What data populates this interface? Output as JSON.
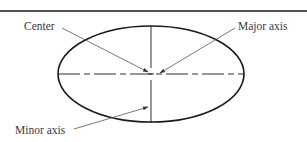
{
  "diagram": {
    "type": "ellipse-anatomy",
    "labels": {
      "center": "Center",
      "major_axis": "Major axis",
      "minor_axis": "Minor axis"
    },
    "colors": {
      "stroke": "#1a1a1a",
      "leader": "#555555",
      "text": "#3a3a3a",
      "background": "#ffffff"
    },
    "ellipse": {
      "cx": 151,
      "cy": 74,
      "rx": 93,
      "ry": 48
    }
  }
}
